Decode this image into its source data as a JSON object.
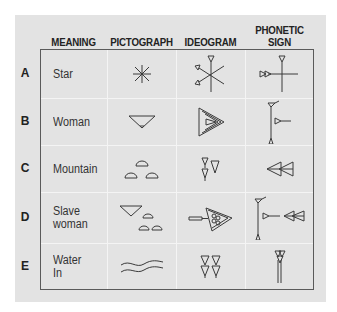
{
  "headers": {
    "meaning": "MEANING",
    "pictograph": "PICTOGRAPH",
    "ideogram": "IDEOGRAM",
    "phonetic": "PHONETIC\nSIGN"
  },
  "rows": [
    {
      "letter": "A",
      "meaning": "Star",
      "pictograph_icon": "star-asterisk-icon",
      "ideogram_icon": "star-cuneiform-icon",
      "phonetic_icon": "an-sign-icon"
    },
    {
      "letter": "B",
      "meaning": "Woman",
      "pictograph_icon": "pubic-triangle-icon",
      "ideogram_icon": "woman-cuneiform-icon",
      "phonetic_icon": "woman-phonetic-icon"
    },
    {
      "letter": "C",
      "meaning": "Mountain",
      "pictograph_icon": "three-mounds-icon",
      "ideogram_icon": "mountain-wedges-icon",
      "phonetic_icon": "mountain-phonetic-icon"
    },
    {
      "letter": "D",
      "meaning": "Slave\nwoman",
      "pictograph_icon": "triangle-and-mounds-icon",
      "ideogram_icon": "slave-woman-cuneiform-icon",
      "phonetic_icon": "slave-woman-phonetic-icon"
    },
    {
      "letter": "E",
      "meaning": "Water\nIn",
      "pictograph_icon": "wavy-lines-icon",
      "ideogram_icon": "water-wedges-icon",
      "phonetic_icon": "water-phonetic-icon"
    }
  ],
  "colors": {
    "panel_background": "#e3e3e3",
    "table_border": "#5a5a5a",
    "grid_lines": "#f4f4f4",
    "ink": "#3a3a3a"
  }
}
